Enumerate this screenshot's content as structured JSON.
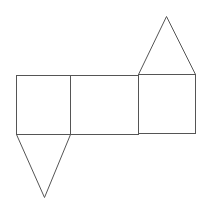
{
  "diagram": {
    "type": "net",
    "stroke_color": "#555555",
    "background": "#ffffff",
    "faces": [
      {
        "name": "left-square",
        "shape": "rect",
        "x": 16,
        "y": 75,
        "w": 54,
        "h": 59
      },
      {
        "name": "middle-rect",
        "shape": "rect",
        "x": 70,
        "y": 75,
        "w": 68,
        "h": 59
      },
      {
        "name": "right-square",
        "shape": "rect",
        "x": 138,
        "y": 74,
        "w": 57,
        "h": 59
      },
      {
        "name": "top-triangle",
        "shape": "triangle",
        "points": [
          [
            138,
            74
          ],
          [
            166,
            16
          ],
          [
            195,
            74
          ]
        ]
      },
      {
        "name": "bottom-triangle",
        "shape": "triangle",
        "points": [
          [
            16,
            134
          ],
          [
            44,
            197
          ],
          [
            70,
            134
          ]
        ]
      }
    ]
  }
}
